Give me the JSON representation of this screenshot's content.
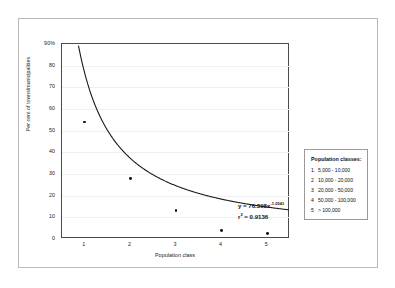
{
  "chart_data": {
    "type": "scatter",
    "title": "",
    "xlabel": "Population class",
    "ylabel": "Per cent of towns/municipalities",
    "x": [
      1,
      2,
      3,
      4,
      5
    ],
    "values": [
      54,
      28,
      13,
      4,
      2.5
    ],
    "xlim": [
      0.5,
      5.5
    ],
    "ylim": [
      0,
      90
    ],
    "grid": true,
    "legend_position": "right-outside",
    "y_ticks": [
      "90%",
      "80",
      "70",
      "60",
      "50",
      "40",
      "30",
      "20",
      "10",
      "0"
    ],
    "y_tick_values": [
      90,
      80,
      70,
      60,
      50,
      40,
      30,
      20,
      10,
      0
    ],
    "x_ticks": [
      "1",
      "2",
      "3",
      "4",
      "5"
    ],
    "trendline": {
      "type": "power",
      "coefficient": 76.398,
      "exponent": -1.0541,
      "r_squared": 0.9136
    },
    "annotations": {
      "equation_prefix": "y = 76.398x",
      "equation_exponent": "-1.0541",
      "r2_label": "r",
      "r2_sup": "2",
      "r2_value": " = 0.9136"
    }
  },
  "legend": {
    "title": "Population classes:",
    "rows": [
      {
        "num": "1.",
        "range": "5,000   - 10,000"
      },
      {
        "num": "2",
        "range": "10,000   - 20,000"
      },
      {
        "num": "3",
        "range": "20,000  - 50,000"
      },
      {
        "num": "4",
        "range": "50,000 - 100,000"
      },
      {
        "num": "5",
        "range": "     > 100,000"
      }
    ]
  }
}
